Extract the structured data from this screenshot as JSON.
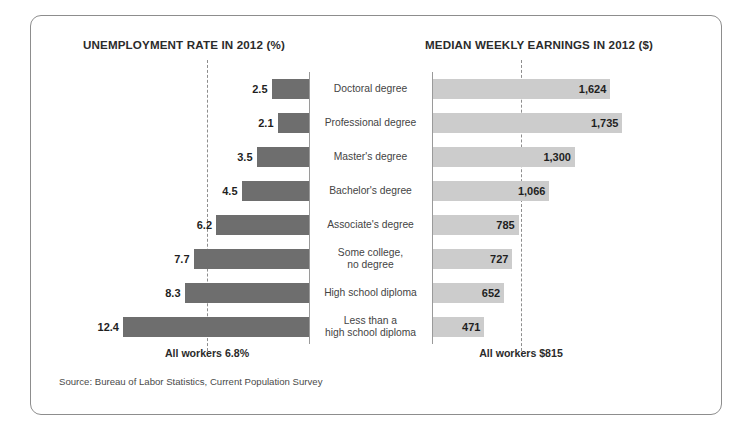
{
  "panel": {
    "left_title": "UNEMPLOYMENT RATE IN 2012 (%)",
    "right_title": "MEDIAN WEEKLY EARNINGS IN 2012 ($)",
    "left_average_label": "All workers 6.8%",
    "right_average_label": "All workers $815",
    "source": "Source: Bureau of Labor Statistics, Current Population Survey"
  },
  "chart_data": {
    "type": "bar",
    "orientation": "horizontal-diverging",
    "categories": [
      "Doctoral degree",
      "Professional degree",
      "Master's degree",
      "Bachelor's degree",
      "Associate's degree",
      "Some college,\nno degree",
      "High school diploma",
      "Less than a\nhigh school diploma"
    ],
    "series": [
      {
        "name": "UNEMPLOYMENT RATE IN 2012 (%)",
        "side": "left",
        "unit": "%",
        "color": "#6e6e6e",
        "values": [
          2.5,
          2.1,
          3.5,
          4.5,
          6.2,
          7.7,
          8.3,
          12.4
        ],
        "labels": [
          "2.5",
          "2.1",
          "3.5",
          "4.5",
          "6.2",
          "7.7",
          "8.3",
          "12.4"
        ],
        "reference_line": {
          "value": 6.8,
          "label": "All workers 6.8%"
        },
        "axis_max": 12.4
      },
      {
        "name": "MEDIAN WEEKLY EARNINGS IN 2012 ($)",
        "side": "right",
        "unit": "$",
        "color": "#cccccc",
        "values": [
          1624,
          1735,
          1300,
          1066,
          785,
          727,
          652,
          471
        ],
        "labels": [
          "1,624",
          "1,735",
          "1,300",
          "1,066",
          "785",
          "727",
          "652",
          "471"
        ],
        "reference_line": {
          "value": 815,
          "label": "All workers $815"
        },
        "axis_max": 1735
      }
    ],
    "grid": false,
    "legend": "none",
    "xlabel": "",
    "ylabel": ""
  }
}
